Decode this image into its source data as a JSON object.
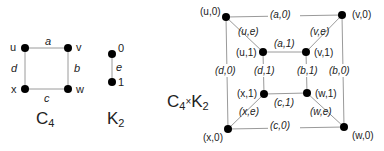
{
  "c4": {
    "title": "C",
    "title_sub": "4",
    "vertices": {
      "u": "u",
      "v": "v",
      "w": "w",
      "x": "x"
    },
    "edges": {
      "a": "a",
      "b": "b",
      "c": "c",
      "d": "d"
    }
  },
  "k2": {
    "title": "K",
    "title_sub": "2",
    "vertices": {
      "zero": "0",
      "one": "1"
    },
    "edges": {
      "e": "e"
    }
  },
  "product": {
    "title_left": "C",
    "title_left_sub": "4",
    "title_op": "×",
    "title_right": "K",
    "title_right_sub": "2",
    "vertices": {
      "u0": "(u,0)",
      "v0": "(v,0)",
      "w0": "(w,0)",
      "x0": "(x,0)",
      "u1": "(u,1)",
      "v1": "(v,1)",
      "w1": "(w,1)",
      "x1": "(x,1)"
    },
    "edges": {
      "a0": "(a,0)",
      "b0": "(b,0)",
      "c0": "(c,0)",
      "d0": "(d,0)",
      "a1": "(a,1)",
      "b1": "(b,1)",
      "c1": "(c,1)",
      "d1": "(d,1)",
      "ue": "(u,e)",
      "ve": "(v,e)",
      "we": "(w,e)",
      "xe": "(x,e)"
    }
  }
}
